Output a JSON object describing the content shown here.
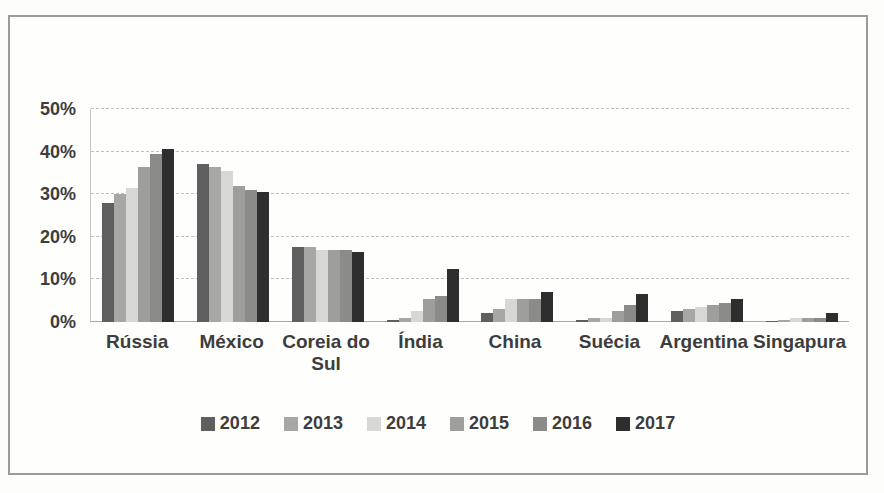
{
  "chart_data": {
    "type": "bar",
    "title": "",
    "categories": [
      "Rússia",
      "México",
      "Coreia do Sul",
      "Índia",
      "China",
      "Suécia",
      "Argentina",
      "Singapura"
    ],
    "series": [
      {
        "name": "2012",
        "color": "#5f5f5f",
        "values": [
          28,
          37,
          17.5,
          0.5,
          2,
          0.5,
          2.5,
          0.2
        ]
      },
      {
        "name": "2013",
        "color": "#a7a7a5",
        "values": [
          30,
          36.5,
          17.5,
          1,
          3,
          1,
          3,
          0.5
        ]
      },
      {
        "name": "2014",
        "color": "#d7d7d4",
        "values": [
          31.5,
          35.5,
          17,
          2.5,
          5.5,
          1,
          3.5,
          1
        ]
      },
      {
        "name": "2015",
        "color": "#9e9e9c",
        "values": [
          36.5,
          32,
          17,
          5.5,
          5.5,
          2.5,
          4,
          1
        ]
      },
      {
        "name": "2016",
        "color": "#8b8b89",
        "values": [
          39.5,
          31,
          17,
          6,
          5.5,
          4,
          4.5,
          1
        ]
      },
      {
        "name": "2017",
        "color": "#2e2e2e",
        "values": [
          40.5,
          30.5,
          16.5,
          12.5,
          7,
          6.5,
          5.5,
          2
        ]
      }
    ],
    "xlabel": "",
    "ylabel": "",
    "ylim": [
      0,
      50
    ],
    "ytick_step": 10,
    "ytick_labels": [
      "0%",
      "10%",
      "20%",
      "30%",
      "40%",
      "50%"
    ],
    "grid": "horizontal-dashed",
    "legend_position": "bottom",
    "colors": {
      "frame_border": "#9b9b98",
      "gridline": "#bfbfbc",
      "axis_text": "#3d3d3d",
      "background": "#fdfdfc"
    }
  }
}
